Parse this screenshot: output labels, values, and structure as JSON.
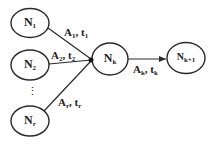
{
  "colors": {
    "stroke": "#2a2a2a",
    "text": "#222222",
    "background": "#ffffff"
  },
  "nodes": [
    {
      "id": "n1",
      "base": "N",
      "sub": "1"
    },
    {
      "id": "n2",
      "base": "N",
      "sub": "2"
    },
    {
      "id": "nr",
      "base": "N",
      "sub": "r"
    },
    {
      "id": "nk",
      "base": "N",
      "sub": "k"
    },
    {
      "id": "nk1",
      "base": "N",
      "sub": "k+1"
    }
  ],
  "edges": [
    {
      "from": "n1",
      "to": "nk",
      "label_a": "A",
      "sub_a": "1",
      "sep": ", ",
      "label_t": "t",
      "sub_t": "1"
    },
    {
      "from": "n2",
      "to": "nk",
      "label_a": "A",
      "sub_a": "2",
      "sep": ", ",
      "label_t": "t",
      "sub_t": "2"
    },
    {
      "from": "nr",
      "to": "nk",
      "label_a": "A",
      "sub_a": "r",
      "sep": ", ",
      "label_t": "t",
      "sub_t": "r"
    },
    {
      "from": "nk",
      "to": "nk1",
      "label_a": "A",
      "sub_a": "k",
      "sep": ", ",
      "label_t": "t",
      "sub_t": "k"
    }
  ],
  "ellipsis": "⋮"
}
